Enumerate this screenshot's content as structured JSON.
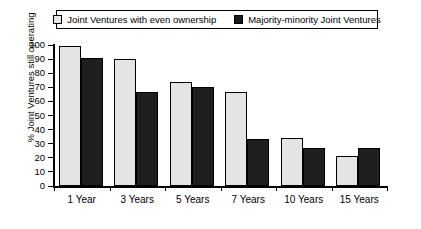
{
  "legend": {
    "items": [
      {
        "label": "Joint Ventures with even ownership",
        "swatch": "light",
        "color": "#e8e8e8",
        "icon": "legend-swatch-light-icon"
      },
      {
        "label": "Majority-minority Joint Ventures",
        "swatch": "dark",
        "color": "#1c1c1c",
        "icon": "legend-swatch-dark-icon"
      }
    ]
  },
  "axes": {
    "y_title": "% Joint Ventures still operating",
    "y_ticks": [
      "0",
      "10",
      "20",
      "30",
      "40",
      "50",
      "60",
      "70",
      "80",
      "90",
      "100"
    ],
    "x_labels": [
      "1 Year",
      "3 Years",
      "5 Years",
      "7 Years",
      "10 Years",
      "15 Years"
    ]
  },
  "chart_data": {
    "type": "bar",
    "title": "",
    "xlabel": "",
    "ylabel": "% Joint Ventures still operating",
    "ylim": [
      0,
      100
    ],
    "ytick_step": 10,
    "grid": false,
    "legend_position": "top",
    "categories": [
      "1 Year",
      "3 Years",
      "5 Years",
      "7 Years",
      "10 Years",
      "15 Years"
    ],
    "series": [
      {
        "name": "Joint Ventures with even ownership",
        "color": "#e4e4e4",
        "values": [
          99,
          90,
          74,
          67,
          34,
          21
        ]
      },
      {
        "name": "Majority-minority Joint Ventures",
        "color": "#1f1f1f",
        "values": [
          91,
          67,
          70,
          33,
          27,
          27
        ]
      }
    ]
  }
}
